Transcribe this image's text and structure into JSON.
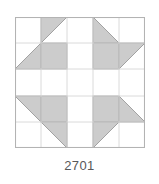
{
  "figure": {
    "label": "2701",
    "type": "quilt-block-diagram",
    "grid_rows": 5,
    "grid_cols": 5,
    "colors": {
      "background": "#ffffff",
      "patch_fill": "#cccccc",
      "patch_stroke": "#9a9a9a",
      "grid_line": "#d6d6d6",
      "frame_line": "#b3b3b3",
      "label_text": "#58585a"
    },
    "units": [
      {
        "name": "top-left-pinwheel",
        "row": 0,
        "col": 0,
        "cells": [
          {
            "position": "top-left",
            "shape": "empty"
          },
          {
            "position": "top-right",
            "shape": "half-square-triangle",
            "shaded_corner": "bottom-left"
          },
          {
            "position": "bottom-left",
            "shape": "half-square-triangle",
            "shaded_corner": "top-right"
          },
          {
            "position": "bottom-right",
            "shape": "full-square"
          }
        ]
      },
      {
        "name": "top-right-pinwheel",
        "row": 0,
        "col": 1,
        "cells": [
          {
            "position": "top-left",
            "shape": "half-square-triangle",
            "shaded_corner": "bottom-right"
          },
          {
            "position": "top-right",
            "shape": "empty"
          },
          {
            "position": "bottom-left",
            "shape": "full-square"
          },
          {
            "position": "bottom-right",
            "shape": "half-square-triangle",
            "shaded_corner": "top-left"
          }
        ]
      },
      {
        "name": "bottom-left-pinwheel",
        "row": 1,
        "col": 0,
        "cells": [
          {
            "position": "top-left",
            "shape": "half-square-triangle",
            "shaded_corner": "bottom-right"
          },
          {
            "position": "top-right",
            "shape": "full-square"
          },
          {
            "position": "bottom-left",
            "shape": "empty"
          },
          {
            "position": "bottom-right",
            "shape": "half-square-triangle",
            "shaded_corner": "top-left"
          }
        ]
      },
      {
        "name": "bottom-right-pinwheel",
        "row": 1,
        "col": 1,
        "cells": [
          {
            "position": "top-left",
            "shape": "full-square"
          },
          {
            "position": "top-right",
            "shape": "half-square-triangle",
            "shaded_corner": "bottom-left"
          },
          {
            "position": "bottom-left",
            "shape": "half-square-triangle",
            "shaded_corner": "top-right"
          },
          {
            "position": "bottom-right",
            "shape": "empty"
          }
        ]
      }
    ],
    "center_cross": "white"
  }
}
